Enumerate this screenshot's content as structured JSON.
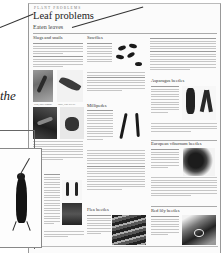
{
  "page": {
    "kicker": "Plant Problems",
    "title": "Leaf problems",
    "subtitle": "Eaten leaves",
    "side_text_fragment": "the"
  },
  "sections": [
    {
      "heading": "Slugs and snails",
      "lead": "Plants affected:",
      "captions": [
        "Slug, snail damage",
        "Snail, vine weevil"
      ]
    },
    {
      "heading": "Sawflies",
      "lead": "Plants affected:"
    },
    {
      "heading": "Millipedes",
      "lead": "Plants affected:"
    },
    {
      "heading": "Asparagus beetles",
      "lead": "Plants affected:"
    },
    {
      "heading": "European viburnum beetles",
      "lead": "Plants affected:"
    },
    {
      "heading": "Flea beetles",
      "lead": "Plants affected:"
    },
    {
      "heading": "Red lily beetles",
      "lead": "Plants affected:"
    }
  ],
  "images": [
    {
      "name": "slug-damage-photo",
      "subject": "slug on leaf"
    },
    {
      "name": "caterpillar-photo",
      "subject": "leaf damage"
    },
    {
      "name": "beetle-on-leaf-photo",
      "subject": "larva on leaf"
    },
    {
      "name": "weevil-photo",
      "subject": "insect"
    },
    {
      "name": "sawfly-larvae-photo",
      "subject": "sawfly larvae"
    },
    {
      "name": "millipede-photo",
      "subject": "millipedes"
    },
    {
      "name": "asparagus-beetle-photo",
      "subject": "asparagus beetles"
    },
    {
      "name": "viburnum-beetle-photo",
      "subject": "damaged viburnum leaf"
    },
    {
      "name": "flea-beetle-photo",
      "subject": "flea beetle damage"
    },
    {
      "name": "lily-beetle-photo",
      "subject": "red lily beetle"
    },
    {
      "name": "earwig-photo",
      "subject": "earwig"
    }
  ]
}
